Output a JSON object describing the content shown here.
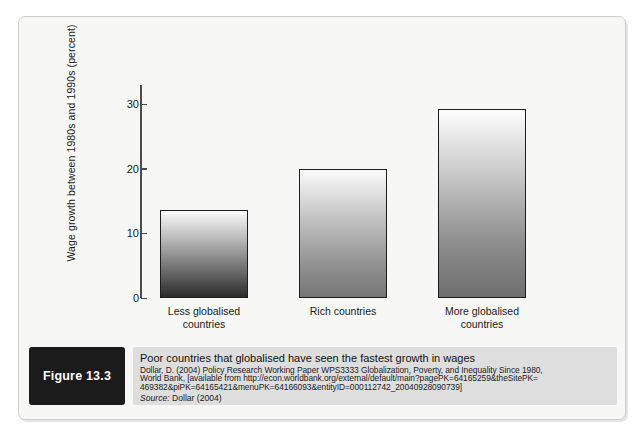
{
  "figure": {
    "badge_label": "Figure 13.3",
    "caption_title": "Poor countries that globalised have seen the fastest growth in wages",
    "reference_lines": [
      "Dollar, D. (2004) Policy Research Working Paper WPS3333 Globalization, Poverty, and Inequality Since 1980,",
      "World Bank, [available from http://econ.worldbank.org/external/default/main?pagePK=64165259&theSitePK=",
      "469382&piPK=64165421&menuPK=64166093&entityID=000112742_20040928090739]"
    ],
    "source_prefix": "Source:",
    "source_value": "Dollar (2004)"
  },
  "chart_data": {
    "type": "bar",
    "title": "",
    "categories": [
      "Less globalised countries",
      "Rich countries",
      "More globalised countries"
    ],
    "category_lines": [
      [
        "Less globalised",
        "countries"
      ],
      [
        "Rich countries"
      ],
      [
        "More globalised",
        "countries"
      ]
    ],
    "values": [
      13.7,
      20.0,
      29.3
    ],
    "xlabel": "",
    "ylabel": "Wage growth between 1980s and 1990s (percent)",
    "ylim": [
      0,
      33
    ],
    "yticks": [
      0,
      10,
      20,
      30
    ],
    "ytick_labels": [
      "0",
      "10",
      "20",
      "30"
    ],
    "grid": false,
    "legend": false
  },
  "style": {
    "bar_outline": "#1d1d1d",
    "axis_color": "#4c4c4c",
    "panel_bg": "#f7f7f5",
    "caption_bg": "#dedede",
    "badge_bg": "#1b1b1b"
  }
}
